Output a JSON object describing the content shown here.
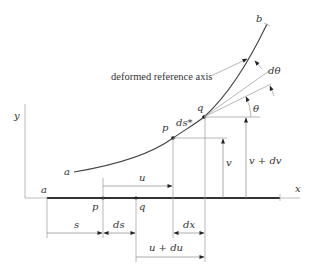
{
  "figure": {
    "caption_label": "deformed reference axis",
    "axes": {
      "x_label": "x",
      "y_label": "y"
    },
    "curve_labels": {
      "start": "a",
      "end": "b"
    },
    "deformed_points": {
      "p": "p",
      "q": "q",
      "arc_length": "ds*"
    },
    "undeformed_points": {
      "a": "a",
      "p": "p",
      "q": "q"
    },
    "angles": {
      "theta": "θ",
      "dtheta": "dθ"
    },
    "dimensions": {
      "s": "s",
      "ds": "ds",
      "u": "u",
      "u_plus_du": "u + du",
      "dx": "dx",
      "v": "v",
      "v_plus_dv": "v + dv"
    },
    "colors": {
      "ink": "#333333",
      "construction": "#9a9a9a"
    }
  }
}
